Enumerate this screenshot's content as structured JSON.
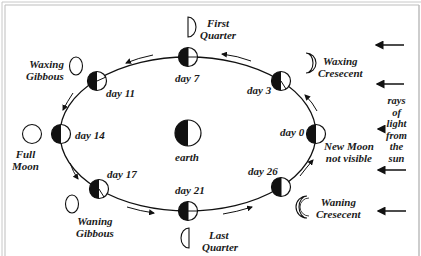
{
  "diagram": {
    "type": "lunar-phases-orbit",
    "center_label": "earth",
    "sun_label": [
      "rays",
      "of",
      "light",
      "from",
      "the",
      "sun"
    ],
    "positions": [
      {
        "day": "day 0",
        "phase": [
          "New Moon",
          "not visible"
        ]
      },
      {
        "day": "day 3",
        "phase": [
          "Waxing",
          "Cresecent"
        ]
      },
      {
        "day": "day 7",
        "phase": [
          "First",
          "Quarter"
        ]
      },
      {
        "day": "day 11",
        "phase": [
          "Waxing",
          "Gibbous"
        ]
      },
      {
        "day": "day 14",
        "phase": [
          "Full",
          "Moon"
        ]
      },
      {
        "day": "day 17",
        "phase": [
          "Waning",
          "Gibbous"
        ]
      },
      {
        "day": "day 21",
        "phase": [
          "Last",
          "Quarter"
        ]
      },
      {
        "day": "day 26",
        "phase": [
          "Waning",
          "Cresecent"
        ]
      }
    ],
    "colors": {
      "ink": "#111111",
      "frame": "#b5b5b5",
      "background": "#ffffff"
    }
  }
}
